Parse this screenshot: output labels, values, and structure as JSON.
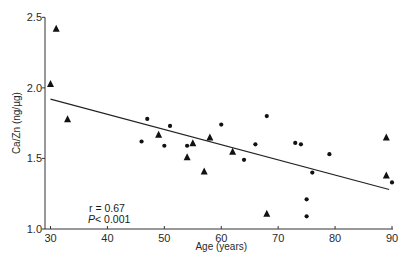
{
  "chart_data": {
    "type": "scatter",
    "title": "",
    "xlabel": "Age (years)",
    "ylabel": "Ca/Zn (ng/µg)",
    "xlim": [
      30,
      90
    ],
    "ylim": [
      1.0,
      2.5
    ],
    "x_ticks": [
      30,
      40,
      50,
      60,
      70,
      80,
      90
    ],
    "y_ticks": [
      1.0,
      1.5,
      2.0,
      2.5
    ],
    "x_tick_labels": [
      "30",
      "40",
      "50",
      "60",
      "70",
      "80",
      "90"
    ],
    "y_tick_labels": [
      "1.0",
      "1.5",
      "2.0",
      "2.5"
    ],
    "grid": false,
    "series": [
      {
        "name": "triangles",
        "marker": "triangle",
        "points": [
          {
            "x": 30,
            "y": 2.03
          },
          {
            "x": 31,
            "y": 2.42
          },
          {
            "x": 33,
            "y": 1.78
          },
          {
            "x": 49,
            "y": 1.67
          },
          {
            "x": 54,
            "y": 1.51
          },
          {
            "x": 55,
            "y": 1.61
          },
          {
            "x": 57,
            "y": 1.41
          },
          {
            "x": 58,
            "y": 1.65
          },
          {
            "x": 62,
            "y": 1.55
          },
          {
            "x": 68,
            "y": 1.11
          },
          {
            "x": 89,
            "y": 1.65
          },
          {
            "x": 89,
            "y": 1.38
          }
        ]
      },
      {
        "name": "dots",
        "marker": "circle",
        "points": [
          {
            "x": 46,
            "y": 1.62
          },
          {
            "x": 47,
            "y": 1.78
          },
          {
            "x": 50,
            "y": 1.59
          },
          {
            "x": 51,
            "y": 1.73
          },
          {
            "x": 54,
            "y": 1.59
          },
          {
            "x": 60,
            "y": 1.74
          },
          {
            "x": 64,
            "y": 1.49
          },
          {
            "x": 66,
            "y": 1.6
          },
          {
            "x": 68,
            "y": 1.8
          },
          {
            "x": 73,
            "y": 1.61
          },
          {
            "x": 74,
            "y": 1.6
          },
          {
            "x": 75,
            "y": 1.21
          },
          {
            "x": 75,
            "y": 1.09
          },
          {
            "x": 76,
            "y": 1.4
          },
          {
            "x": 79,
            "y": 1.53
          },
          {
            "x": 90,
            "y": 1.33
          }
        ]
      }
    ],
    "regression_line": {
      "x": [
        30,
        89.5
      ],
      "y": [
        1.92,
        1.28
      ]
    },
    "annotations": [
      "r = 0.67",
      "P< 0.001"
    ],
    "legend": "none"
  }
}
